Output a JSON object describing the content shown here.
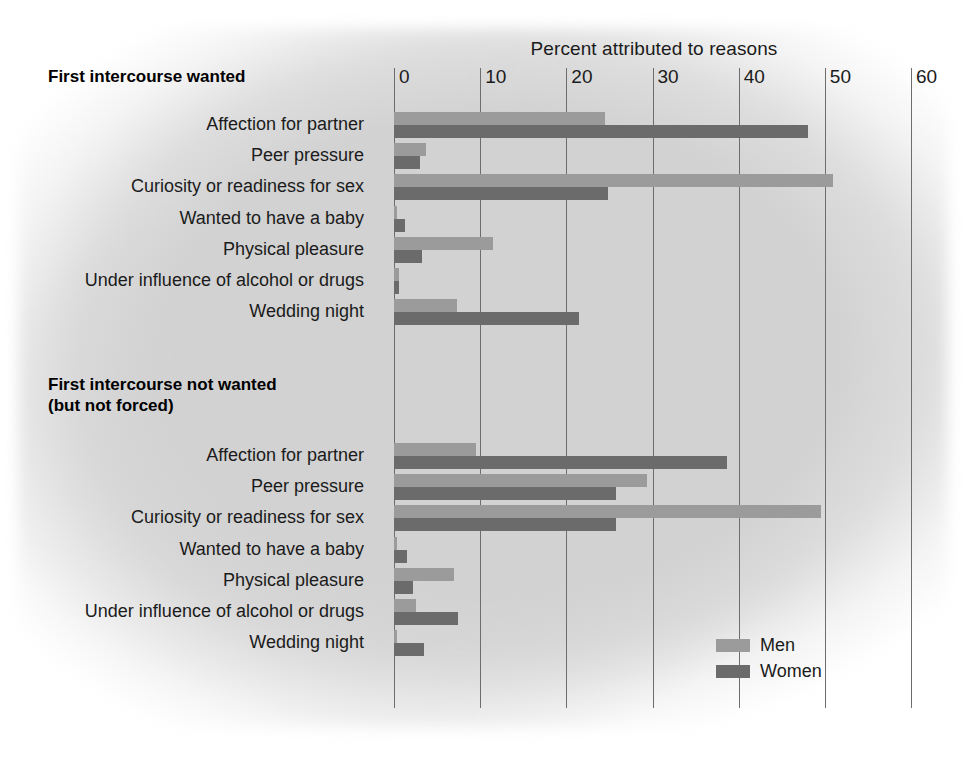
{
  "chart_data": {
    "type": "bar",
    "orientation": "horizontal",
    "title": "Percent attributed to reasons",
    "xlabel": "Percent attributed to reasons",
    "ylabel": "",
    "xlim": [
      0,
      60
    ],
    "xticks": [
      0,
      10,
      20,
      30,
      40,
      50,
      60
    ],
    "grid": true,
    "legend_position": "bottom-right",
    "legend": [
      "Men",
      "Women"
    ],
    "colors": {
      "men": "#9b9b9b",
      "women": "#6b6b6b",
      "gridline": "#6d6d6d",
      "background": "#d2d2d2",
      "text": "#1b1b1b"
    },
    "categories": [
      "Affection for partner",
      "Peer pressure",
      "Curiosity or readiness for sex",
      "Wanted to have a baby",
      "Physical pleasure",
      "Under influence of alcohol or drugs",
      "Wedding night"
    ],
    "groups": [
      {
        "heading": "First intercourse wanted",
        "series": [
          {
            "name": "Men",
            "values": [
              24.5,
              3.7,
              51.0,
              0.4,
              11.5,
              0.6,
              7.3
            ]
          },
          {
            "name": "Women",
            "values": [
              48.0,
              3.0,
              24.8,
              1.3,
              3.3,
              0.6,
              21.5
            ]
          }
        ]
      },
      {
        "heading": "First intercourse not wanted\n(but not forced)",
        "heading_line1": "First intercourse not wanted",
        "heading_line2": "(but not forced)",
        "series": [
          {
            "name": "Men",
            "values": [
              9.5,
              29.4,
              49.6,
              0.3,
              7.0,
              2.5,
              0.4
            ]
          },
          {
            "name": "Women",
            "values": [
              38.6,
              25.8,
              25.8,
              1.5,
              2.2,
              7.4,
              3.5
            ]
          }
        ]
      }
    ]
  },
  "axis": {
    "title": "Percent attributed to reasons",
    "ticks": [
      {
        "label": "0",
        "value": 0
      },
      {
        "label": "10",
        "value": 10
      },
      {
        "label": "20",
        "value": 20
      },
      {
        "label": "30",
        "value": 30
      },
      {
        "label": "40",
        "value": 40
      },
      {
        "label": "50",
        "value": 50
      },
      {
        "label": "60",
        "value": 60
      }
    ]
  },
  "groups": {
    "g1": {
      "heading": "First intercourse wanted"
    },
    "g2": {
      "heading_line1": "First intercourse not wanted",
      "heading_line2": "(but not forced)"
    }
  },
  "labels": {
    "affection": "Affection for partner",
    "peer": "Peer pressure",
    "curiosity": "Curiosity or readiness for sex",
    "baby": "Wanted to have a baby",
    "pleasure": "Physical pleasure",
    "alcohol": "Under influence of alcohol or drugs",
    "wedding": "Wedding night"
  },
  "legend": {
    "men": "Men",
    "women": "Women"
  }
}
